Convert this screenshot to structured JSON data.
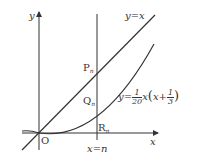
{
  "diagram": {
    "axes": {
      "x_label": "x",
      "y_label": "y",
      "origin_label": "O"
    },
    "line": {
      "label": "y=x"
    },
    "curve": {
      "label_lhs": "y=",
      "frac1_num": "1",
      "frac1_den": "20",
      "mid": "x",
      "paren_open": "(",
      "inner": "x+",
      "frac2_num": "1",
      "frac2_den": "3",
      "paren_close": ")"
    },
    "vertical_line": {
      "label": "x=n"
    },
    "points": [
      {
        "name": "P",
        "sub": "n"
      },
      {
        "name": "Q",
        "sub": "n"
      },
      {
        "name": "R",
        "sub": "n"
      }
    ],
    "colors": {
      "stroke": "#333333",
      "background": "#ffffff"
    }
  }
}
